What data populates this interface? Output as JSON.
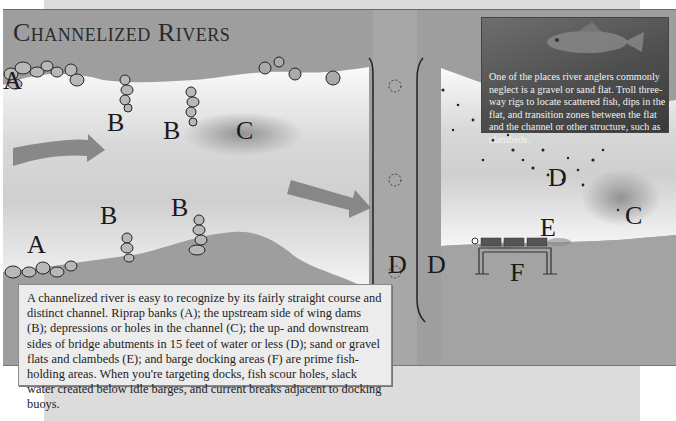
{
  "title": "Channelized Rivers",
  "labels": {
    "a_top": "A",
    "a_bottom": "A",
    "b1_top": "B",
    "b2_top": "B",
    "b1_bottom": "B",
    "b2_bottom": "B",
    "c_left": "C",
    "c_right": "C",
    "d_left": "D",
    "d_right": "D",
    "d_flat": "D",
    "e": "E",
    "f": "F"
  },
  "callout": {
    "text": "One of the places river anglers commonly neglect is a gravel or sand flat. Troll three-way rigs to locate scattered fish, dips in the flat, and transition zones between the flat and the channel or other structure, such as clambeds.",
    "image": "fish-photo"
  },
  "caption": {
    "text": "A channelized river is easy to recognize by its fairly straight course and distinct channel. Riprap banks (A); the upstream side of wing dams (B); depressions or holes in the channel (C); the up- and downstream sides of bridge abutments in 15 feet of water or less (D); sand or gravel flats and clambeds (E); and barge docking areas (F) are prime fish-holding areas. When you're targeting docks, fish scour holes, slack water created below idle barges, and current breaks adjacent to docking buoys."
  },
  "icons": [
    "current-arrow-icon",
    "current-arrow-icon",
    "bridge-piling-icon",
    "barge-icon",
    "dock-icon",
    "riprap-icon",
    "wing-dam-icon"
  ],
  "colors": {
    "bank": "#9e9e9e",
    "water": "#f4f4f4",
    "arrow": "#808080",
    "barge": "#555555",
    "callout_bg": "#4e4e4e"
  }
}
